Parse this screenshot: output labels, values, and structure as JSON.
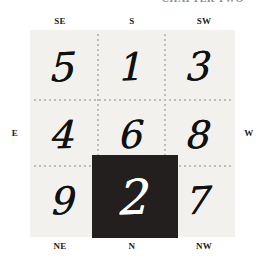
{
  "page": {
    "running_head": "CHAPTER TWO",
    "background_color": "#ffffff",
    "panel_color": "#f2f1ee",
    "gridline_color": "#bdbcb9",
    "highlight_color": "#231f1e",
    "highlight_text_color": "#ffffff"
  },
  "compass": {
    "top_left": "SE",
    "top_center": "S",
    "top_right": "SW",
    "left": "E",
    "right": "W",
    "bottom_left": "NE",
    "bottom_center": "N",
    "bottom_right": "NW"
  },
  "chart_data": {
    "type": "table",
    "title": "",
    "rows": 3,
    "cols": 3,
    "grid": [
      [
        "5",
        "1",
        "3"
      ],
      [
        "4",
        "6",
        "8"
      ],
      [
        "9",
        "2",
        "7"
      ]
    ],
    "highlighted_cell": {
      "row": 2,
      "col": 1,
      "value": "2"
    },
    "axis_labels": {
      "top": [
        "SE",
        "S",
        "SW"
      ],
      "bottom": [
        "NE",
        "N",
        "NW"
      ],
      "left": [
        "E"
      ],
      "right": [
        "W"
      ]
    },
    "grid_on": true,
    "legend": []
  },
  "cells": {
    "r0c0": "5",
    "r0c1": "1",
    "r0c2": "3",
    "r1c0": "4",
    "r1c1": "6",
    "r1c2": "8",
    "r2c0": "9",
    "r2c2": "7",
    "highlight": "2"
  }
}
